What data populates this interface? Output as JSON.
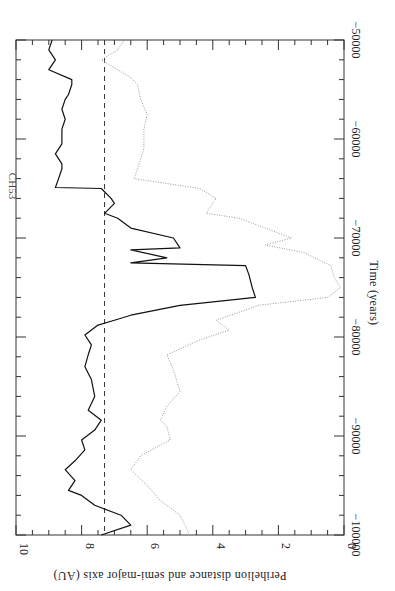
{
  "chart_data": {
    "type": "line",
    "orientation": "rotated-90-clockwise",
    "title": "",
    "annotation": "CH53",
    "xlabel": "Time (years)",
    "ylabel": "Perihelion distance and semi-major axis (AU)",
    "xlim": [
      -100000,
      -50000
    ],
    "ylim": [
      0,
      10
    ],
    "x_ticks": [
      -100000,
      -90000,
      -80000,
      -70000,
      -60000,
      -50000
    ],
    "x_tick_labels": [
      "−100000",
      "−90000",
      "−80000",
      "−70000",
      "−60000",
      "−50000"
    ],
    "y_ticks": [
      0,
      2,
      4,
      6,
      8,
      10
    ],
    "y_tick_labels": [
      "0",
      "2",
      "4",
      "6",
      "8",
      "10"
    ],
    "grid": false,
    "legend": null,
    "reference_line": {
      "style": "dashed",
      "value": 7.3,
      "meaning": "reference level"
    },
    "series": [
      {
        "name": "Semi-major axis",
        "style": "solid",
        "color": "#000000",
        "x": [
          -100000,
          -99000,
          -98000,
          -97000,
          -96000,
          -95500,
          -94500,
          -93400,
          -92500,
          -91400,
          -90400,
          -89400,
          -88400,
          -87400,
          -86000,
          -84300,
          -83000,
          -81800,
          -80800,
          -79800,
          -78800,
          -78300,
          -77800,
          -76800,
          -76000,
          -75000,
          -73700,
          -72800,
          -72500,
          -72000,
          -71200,
          -71000,
          -70000,
          -69000,
          -68000,
          -67500,
          -66500,
          -66000,
          -65000,
          -64900,
          -64000,
          -63000,
          -62500,
          -61500,
          -60500,
          -59000,
          -58000,
          -57000,
          -56000,
          -55500,
          -54500,
          -54000,
          -53000,
          -52000,
          -51000,
          -50000
        ],
        "values": [
          7.4,
          6.5,
          6.8,
          7.6,
          8.0,
          8.4,
          8.2,
          8.5,
          8.2,
          7.9,
          8.0,
          7.6,
          7.4,
          7.8,
          7.6,
          7.7,
          7.9,
          7.8,
          7.7,
          7.9,
          7.5,
          7.0,
          6.5,
          5.0,
          2.7,
          2.8,
          2.9,
          3.0,
          6.5,
          5.4,
          6.5,
          5.0,
          5.2,
          6.5,
          6.9,
          7.3,
          7.0,
          7.1,
          7.4,
          8.8,
          8.7,
          8.6,
          8.6,
          8.8,
          8.6,
          8.6,
          8.5,
          8.6,
          8.5,
          8.4,
          8.3,
          8.3,
          9.0,
          8.8,
          9.0,
          8.9
        ]
      },
      {
        "name": "Perihelion distance",
        "style": "dotted",
        "color": "#888888",
        "x": [
          -100000,
          -98000,
          -96500,
          -95000,
          -93400,
          -92000,
          -90400,
          -89000,
          -88400,
          -87000,
          -85500,
          -83300,
          -81800,
          -80300,
          -79300,
          -78300,
          -77500,
          -76800,
          -76000,
          -75000,
          -74000,
          -72800,
          -72000,
          -71500,
          -70700,
          -70000,
          -69000,
          -68000,
          -67500,
          -66000,
          -65000,
          -64000,
          -63000,
          -61000,
          -59000,
          -57500,
          -56000,
          -54500,
          -53800,
          -52000,
          -51000,
          -50000
        ],
        "values": [
          4.7,
          5.0,
          5.6,
          6.0,
          6.5,
          6.2,
          5.3,
          5.4,
          5.6,
          5.4,
          5.0,
          5.2,
          5.4,
          4.4,
          3.5,
          3.9,
          3.2,
          2.6,
          0.5,
          0.1,
          0.3,
          0.4,
          0.9,
          1.2,
          2.4,
          1.6,
          2.4,
          3.2,
          4.2,
          3.9,
          4.4,
          6.4,
          6.3,
          6.1,
          6.1,
          6.0,
          6.2,
          6.3,
          6.5,
          7.4,
          6.9,
          6.7
        ]
      }
    ]
  }
}
